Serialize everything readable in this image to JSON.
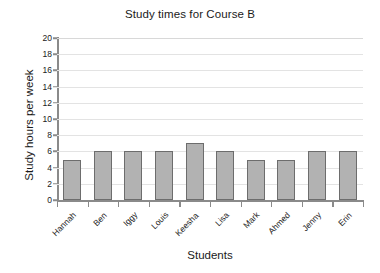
{
  "chart_data": {
    "type": "bar",
    "title": "Study times for Course B",
    "xlabel": "Students",
    "ylabel": "Study hours per week",
    "categories": [
      "Hannah",
      "Ben",
      "Iggy",
      "Louis",
      "Keesha",
      "Lisa",
      "Mark",
      "Ahmed",
      "Jenny",
      "Erin"
    ],
    "values": [
      5,
      6,
      6,
      6,
      7,
      6,
      5,
      5,
      6,
      6
    ],
    "ylim": [
      0,
      20
    ],
    "ytick_step": 2,
    "yticks": [
      0,
      2,
      4,
      6,
      8,
      10,
      12,
      14,
      16,
      18,
      20
    ],
    "ytick_labels": [
      "0",
      "2",
      "4",
      "6",
      "8",
      "10",
      "12",
      "14",
      "16",
      "18",
      "20"
    ],
    "grid": true,
    "grid_axis": "y",
    "legend": false,
    "legend_position": "none",
    "bar_color": "#b2b2b2",
    "bar_edge_color": "#6d6d6d",
    "gridline_color": "#e3e3e3",
    "axis_color": "#8a8a8a",
    "text_color": "#1a1a1a",
    "background": "#ffffff",
    "xtick_label_rotation": -45
  }
}
